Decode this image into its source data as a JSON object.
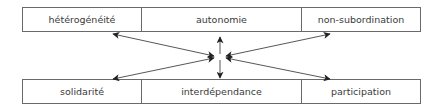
{
  "diagram": {
    "top_row": [
      {
        "label": "hétérogénéité"
      },
      {
        "label": "autonomie"
      },
      {
        "label": "non-subordination"
      }
    ],
    "bottom_row": [
      {
        "label": "solidarité"
      },
      {
        "label": "interdépendance"
      },
      {
        "label": "participation"
      }
    ],
    "center": {
      "x": 220,
      "y": 57
    },
    "arrows": [
      {
        "from": "center",
        "to": "hétérogénéité",
        "style": "double-headed"
      },
      {
        "from": "center",
        "to": "non-subordination",
        "style": "double-headed"
      },
      {
        "from": "center",
        "to": "solidarité",
        "style": "double-headed"
      },
      {
        "from": "center",
        "to": "participation",
        "style": "double-headed"
      },
      {
        "from": "center",
        "to": "autonomie",
        "style": "single-headed"
      },
      {
        "from": "center",
        "to": "interdépendance",
        "style": "single-headed"
      }
    ],
    "colors": {
      "border": "#6a6a6a",
      "text": "#3a3a3a",
      "arrow": "#222222"
    }
  }
}
